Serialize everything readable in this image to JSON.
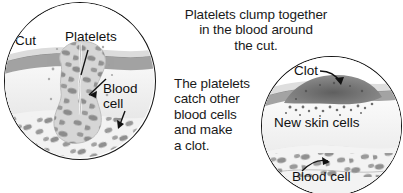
{
  "figure": {
    "palette": {
      "ink": "#141414",
      "epidermis": "#9a9a9a",
      "dermis": "#ededed",
      "subcutaneous": "#f4f4f4",
      "plug": "#cfcfcf",
      "cell": "#8d8d8d",
      "clot": "#6b6b6b",
      "background": "#ffffff"
    }
  },
  "captions": {
    "one": "Platelets clump together\nin the blood around\nthe cut.",
    "two": "The platelets\ncatch other\nblood cells\nand make\na clot."
  },
  "panel_left": {
    "name": "platelet-plug-view",
    "labels": {
      "cut": "Cut",
      "platelets": "Platelets",
      "blood_cell": "Blood\ncell"
    }
  },
  "panel_right": {
    "name": "clot-healing-view",
    "labels": {
      "clot": "Clot",
      "new_skin_cells": "New skin cells",
      "blood_cell": "Blood cell"
    }
  }
}
